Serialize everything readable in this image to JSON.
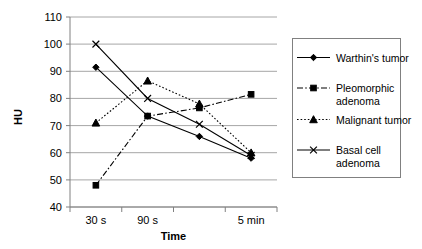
{
  "chart_data": {
    "type": "line",
    "title": "",
    "xlabel": "Time",
    "ylabel": "HU",
    "categories": [
      "30 s",
      "90 s",
      "",
      "5 min"
    ],
    "tick_labels_visible": [
      "30 s",
      "90 s",
      "5 min"
    ],
    "ylim": [
      40,
      110
    ],
    "ytick_step": 10,
    "yticks": [
      40,
      50,
      60,
      70,
      80,
      90,
      100,
      110
    ],
    "grid": "horizontal",
    "legend_position": "right",
    "series": [
      {
        "name": "Warthin's tumor",
        "marker": "diamond",
        "line_style": "solid",
        "color": "#000000",
        "values": [
          91.5,
          73.5,
          66,
          58
        ]
      },
      {
        "name": "Pleomorphic adenoma",
        "marker": "square",
        "line_style": "dash-dot",
        "color": "#000000",
        "values": [
          48,
          73.5,
          76.5,
          81.5
        ]
      },
      {
        "name": "Malignant tumor",
        "marker": "triangle",
        "line_style": "dotted",
        "color": "#000000",
        "values": [
          71,
          86.5,
          78,
          60
        ]
      },
      {
        "name": "Basal cell adenoma",
        "marker": "cross",
        "line_style": "solid",
        "color": "#000000",
        "values": [
          100,
          80,
          70.5,
          59
        ]
      }
    ]
  },
  "legend": {
    "entries": [
      {
        "label_line1": "Warthin's tumor",
        "label_line2": ""
      },
      {
        "label_line1": "Pleomorphic",
        "label_line2": "adenoma"
      },
      {
        "label_line1": "Malignant tumor",
        "label_line2": ""
      },
      {
        "label_line1": "Basal cell",
        "label_line2": "adenoma"
      }
    ]
  },
  "axes": {
    "y_title": "HU",
    "x_title": "Time",
    "y_tick_labels": [
      "110",
      "100",
      "90",
      "80",
      "70",
      "60",
      "50",
      "40"
    ],
    "x_tick_labels": [
      "30 s",
      "90 s",
      "5 min"
    ]
  }
}
